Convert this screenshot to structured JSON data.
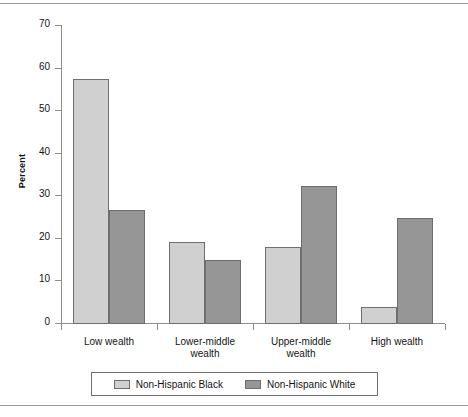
{
  "chart_data": {
    "type": "bar",
    "title": "",
    "xlabel": "",
    "ylabel": "Percent",
    "ylim": [
      0,
      70
    ],
    "yticks": [
      0,
      10,
      20,
      30,
      40,
      50,
      60,
      70
    ],
    "grid": false,
    "legend_position": "bottom",
    "categories": [
      "Low wealth",
      "Lower-middle wealth",
      "Upper-middle wealth",
      "High wealth"
    ],
    "series": [
      {
        "name": "Non-Hispanic Black",
        "color": "#d0d0d0",
        "values": [
          57.5,
          19.3,
          18.2,
          4.0
        ]
      },
      {
        "name": "Non-Hispanic White",
        "color": "#969696",
        "values": [
          26.8,
          15.0,
          32.3,
          24.8
        ]
      }
    ]
  },
  "axis": {
    "y_label": "Percent",
    "y_tick_labels": [
      "70",
      "60",
      "50",
      "40",
      "30",
      "20",
      "10",
      "0"
    ]
  },
  "category_labels": [
    {
      "line1": "Low wealth",
      "line2": ""
    },
    {
      "line1": "Lower-middle",
      "line2": "wealth"
    },
    {
      "line1": "Upper-middle",
      "line2": "wealth"
    },
    {
      "line1": "High wealth",
      "line2": ""
    }
  ],
  "legend": {
    "entries": [
      {
        "label": "Non-Hispanic Black",
        "color": "#d0d0d0"
      },
      {
        "label": "Non-Hispanic White",
        "color": "#969696"
      }
    ]
  },
  "style": {
    "bar_border": "#6e6e6e",
    "axis_color": "#8d8d8d",
    "rule_color": "#9a9a9a",
    "text_color": "#141414",
    "background": "#ffffff"
  }
}
